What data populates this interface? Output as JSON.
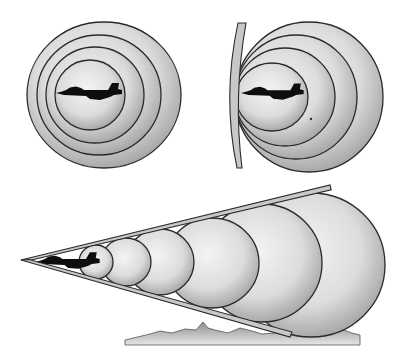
{
  "title": "Sound waves around an aircraft: subsonic, at the sound barrier, and supersonic (Mach cone)",
  "colors": {
    "background": "#ffffff",
    "outline": "#2a2a2a",
    "wave_center": "#f4f4f4",
    "wave_mid": "#dcdcdc",
    "wave_edge": "#a9a9a9",
    "aircraft": "#0d0d0d",
    "cone_band": "#c8c8c8",
    "ground": "#9a9a9a"
  },
  "panels": [
    {
      "id": "subsonic",
      "label": "Subsonic flight - sound waves spread ahead of aircraft",
      "aircraft": {
        "x": 56,
        "y": 93,
        "scale": 1.0
      },
      "waves": [
        {
          "cx": 104,
          "cy": 95,
          "rx": 77,
          "ry": 73
        },
        {
          "cx": 99,
          "cy": 95,
          "rx": 62,
          "ry": 60
        },
        {
          "cx": 95,
          "cy": 95,
          "rx": 49,
          "ry": 48
        },
        {
          "cx": 90,
          "cy": 95,
          "rx": 35,
          "ry": 35
        }
      ]
    },
    {
      "id": "sonic",
      "label": "Mach 1 - sound waves pile up into a barrier ahead of aircraft",
      "aircraft": {
        "x": 241,
        "y": 93,
        "scale": 0.95
      },
      "barrier": {
        "top": [
          238,
          23
        ],
        "mid": [
          229,
          97
        ],
        "bottom": [
          237,
          168
        ],
        "width": 8
      },
      "dot": {
        "x": 311,
        "y": 119
      },
      "waves": [
        {
          "cx": 309,
          "cy": 97,
          "rx": 74,
          "ry": 75
        },
        {
          "cx": 296,
          "cy": 97,
          "rx": 61,
          "ry": 62
        },
        {
          "cx": 285,
          "cy": 97,
          "rx": 50,
          "ry": 49
        },
        {
          "cx": 272,
          "cy": 97,
          "rx": 36,
          "ry": 34
        }
      ]
    },
    {
      "id": "supersonic",
      "label": "Supersonic flight - waves trail behind forming a Mach cone that reaches the ground",
      "aircraft": {
        "x": 35,
        "y": 262,
        "scale": 0.98
      },
      "cone": {
        "apex": [
          21,
          260
        ],
        "top_end": [
          330,
          185
        ],
        "bottom_end": [
          290,
          337
        ],
        "band": 5
      },
      "waves": [
        {
          "cx": 311,
          "cy": 265,
          "rx": 74,
          "ry": 72
        },
        {
          "cx": 262,
          "cy": 263,
          "rx": 60,
          "ry": 59
        },
        {
          "cx": 212,
          "cy": 263,
          "rx": 47,
          "ry": 45
        },
        {
          "cx": 160,
          "cy": 262,
          "rx": 34,
          "ry": 33
        },
        {
          "cx": 126,
          "cy": 262,
          "rx": 25,
          "ry": 24
        },
        {
          "cx": 96,
          "cy": 262,
          "rx": 17,
          "ry": 17
        }
      ],
      "ground": {
        "x_start": 125,
        "x_end": 360,
        "base_y": 340
      }
    }
  ]
}
